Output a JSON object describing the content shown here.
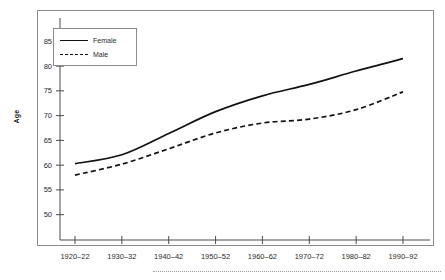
{
  "chart_data": {
    "type": "line",
    "title": "",
    "subtitle": "",
    "xlabel": "",
    "ylabel": "Age",
    "categories": [
      "1920–22",
      "1930–32",
      "1940–42",
      "1950–52",
      "1960–62",
      "1970–72",
      "1980–82",
      "1990–92"
    ],
    "series": [
      {
        "name": "Female",
        "style": "solid",
        "values": [
          60.3,
          62.1,
          66.4,
          70.8,
          74.0,
          76.3,
          79.0,
          81.5
        ]
      },
      {
        "name": "Male",
        "style": "dashed",
        "values": [
          58.0,
          60.2,
          63.3,
          66.5,
          68.5,
          69.3,
          71.2,
          74.8
        ]
      }
    ],
    "ylim": [
      46.5,
      88.5
    ],
    "yticks": [
      50,
      55,
      60,
      65,
      70,
      75,
      80,
      85
    ],
    "ytick_labels": [
      "50",
      "55",
      "60",
      "65",
      "70",
      "75",
      "80",
      "85"
    ],
    "grid": false,
    "legend_position": "upper-left",
    "legend_entries": [
      "Female",
      "Male"
    ],
    "annotations": []
  },
  "colors": {
    "female_line": "#111111",
    "male_line": "#111111",
    "frame": "#8a8a8a",
    "axis": "#4a4a4a",
    "text": "#2b2b2b",
    "footer_rule": "#9a9a9a",
    "background": "#ffffff"
  }
}
